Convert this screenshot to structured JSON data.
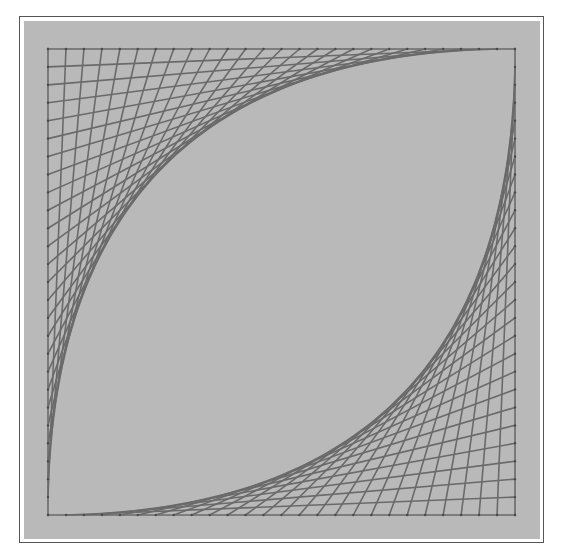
{
  "figure": {
    "colors": {
      "background": "#b9b9b9",
      "thread": "#6a6a6a",
      "pin": "#4a4a4a",
      "frame": "#555555"
    },
    "square": {
      "left": 48,
      "top": 49,
      "right": 515,
      "bottom": 515
    },
    "intervals": 26,
    "thread_width": 1.6,
    "corners": [
      {
        "name": "top-left",
        "corner": "top-left"
      },
      {
        "name": "bottom-right",
        "corner": "bottom-right"
      }
    ]
  }
}
